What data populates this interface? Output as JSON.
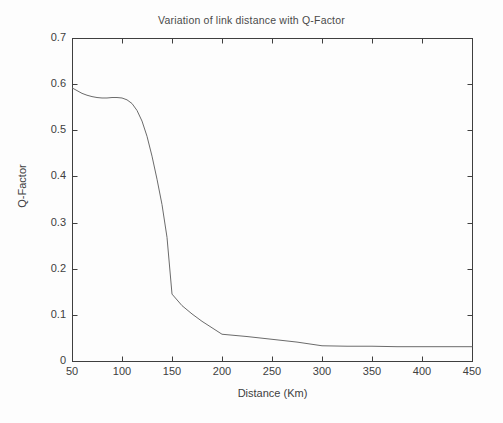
{
  "chart_data": {
    "type": "line",
    "title": "Variation of link distance with Q-Factor",
    "xlabel": "Distance (Km)",
    "ylabel": "Q-Factor",
    "xlim": [
      50,
      450
    ],
    "ylim": [
      0,
      0.7
    ],
    "grid": false,
    "legend": null,
    "line_color": "#6b6b6b",
    "axis_color": "#3f3f3f",
    "background_color": "#fdfdfd",
    "xticks": [
      50,
      100,
      150,
      200,
      250,
      300,
      350,
      400,
      450
    ],
    "xtick_labels": [
      "50",
      "100",
      "150",
      "200",
      "250",
      "300",
      "350",
      "400",
      "450"
    ],
    "yticks": [
      0,
      0.1,
      0.2,
      0.3,
      0.4,
      0.5,
      0.6,
      0.7
    ],
    "ytick_labels": [
      "0",
      "0.1",
      "0.2",
      "0.3",
      "0.4",
      "0.5",
      "0.6",
      "0.7"
    ],
    "series": [
      {
        "name": "Q-Factor vs Distance",
        "x": [
          50,
          55,
          60,
          65,
          70,
          75,
          80,
          85,
          90,
          95,
          100,
          105,
          110,
          115,
          120,
          125,
          130,
          135,
          140,
          145,
          150,
          160,
          170,
          180,
          190,
          200,
          210,
          225,
          250,
          275,
          300,
          325,
          350,
          375,
          400,
          425,
          450
        ],
        "values": [
          0.592,
          0.586,
          0.58,
          0.576,
          0.573,
          0.571,
          0.57,
          0.57,
          0.571,
          0.571,
          0.57,
          0.566,
          0.558,
          0.543,
          0.52,
          0.487,
          0.444,
          0.394,
          0.339,
          0.268,
          0.145,
          0.12,
          0.102,
          0.086,
          0.072,
          0.058,
          0.056,
          0.053,
          0.047,
          0.041,
          0.033,
          0.032,
          0.032,
          0.031,
          0.031,
          0.031,
          0.031
        ]
      }
    ]
  }
}
